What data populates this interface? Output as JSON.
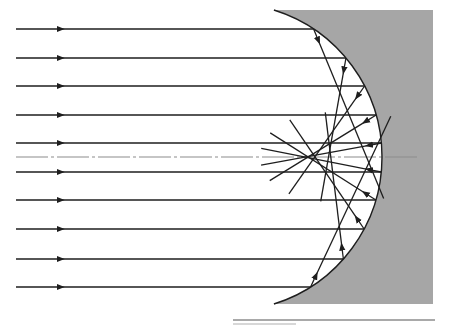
{
  "diagram": {
    "canvas": {
      "width": 449,
      "height": 325
    },
    "colors": {
      "background": "#ffffff",
      "mirror_fill": "#a6a6a6",
      "ray": "#1e1e1e",
      "axis": "#8c8c8c",
      "rule": "#555555",
      "rule_short": "#b0b0b0"
    },
    "mirror": {
      "center": [
        228,
        157
      ],
      "radius": 154,
      "top_y": 10,
      "bottom_y": 304,
      "right_x": 433
    },
    "optical_axis": {
      "y": 157,
      "x_start": 16,
      "x_end": 420
    },
    "incident_rays": {
      "x_start": 16,
      "arrow_x": 62,
      "y_values": [
        29,
        58,
        86,
        115,
        143,
        172,
        200,
        229,
        259,
        287
      ]
    },
    "reflected_ray_overshoot": 45,
    "rule_line": {
      "y": 320,
      "x_start": 233,
      "x_end": 435
    },
    "rule_short": {
      "y": 324,
      "x_start": 233,
      "x_end": 296
    }
  }
}
